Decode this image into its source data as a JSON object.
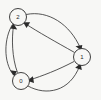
{
  "figure": {
    "kind": "directed-graph",
    "width": 101,
    "height": 100,
    "background_color": "#f7f7f5",
    "stroke_color": "#2b2b2b",
    "node_fill_color": "#f7f7f5",
    "node_radius": 8.5,
    "label_font_size": 6
  },
  "chart_data": {
    "type": "diagram",
    "title": "",
    "xlabel": "",
    "ylabel": "",
    "grid": false,
    "legend": null,
    "directed": true,
    "node_count": 3,
    "edge_count": 6,
    "nodes": [
      {
        "id": "2",
        "label": "2",
        "cx": 18,
        "cy": 17,
        "r": 8.5
      },
      {
        "id": "1",
        "label": "1",
        "cx": 82,
        "cy": 57,
        "r": 8.5
      },
      {
        "id": "0",
        "label": "0",
        "cx": 21,
        "cy": 81,
        "r": 8.5
      }
    ],
    "edges": [
      {
        "id": "e-2-0",
        "source": "2",
        "target": "0",
        "curve": "left-outer",
        "arrow_at": "0",
        "path": "M 12.5 24.5 C 4 38 3 62 13.5 75",
        "arrow": "14.2,76.3 10.2,70.2 17.0,71.3"
      },
      {
        "id": "e-0-2",
        "source": "0",
        "target": "2",
        "curve": "left-inner",
        "arrow_at": "2",
        "path": "M 17.5 72.6 C 12 58 11.5 38 13.6 25.6",
        "arrow": "13.3,23.3 17.2,29.5 10.4,28.5"
      },
      {
        "id": "e-2-1",
        "source": "2",
        "target": "1",
        "curve": "top-outer",
        "arrow_at": "1",
        "path": "M 26.2 14.5 C 48 10 70 24 80.5 48.4",
        "arrow": "81.4,50.6 75.5,46.3 82.3,44.9"
      },
      {
        "id": "e-1-2",
        "source": "1",
        "target": "2",
        "curve": "mid-inner",
        "arrow_at": "2",
        "path": "M 74.6 52.5 C 56 42 38 32 25.2 23.6",
        "arrow": "23.2,22.3 30.2,22.3 26.5,28.0"
      },
      {
        "id": "e-1-0",
        "source": "1",
        "target": "0",
        "curve": "mid-lower",
        "arrow_at": "0",
        "path": "M 74.0 61.5 C 58 70 42 76 29.5 80.0",
        "arrow": "27.3,80.7 32.9,76.3 34.0,82.9"
      },
      {
        "id": "e-0-1",
        "source": "0",
        "target": "1",
        "curve": "bottom-outer",
        "arrow_at": "1",
        "path": "M 28.0 86.0 C 46 96 70 92 79.8 65.5",
        "arrow": "80.6,63.2 81.8,70.0 75.2,67.8"
      }
    ],
    "node_labels": [
      "2",
      "1",
      "0"
    ]
  }
}
